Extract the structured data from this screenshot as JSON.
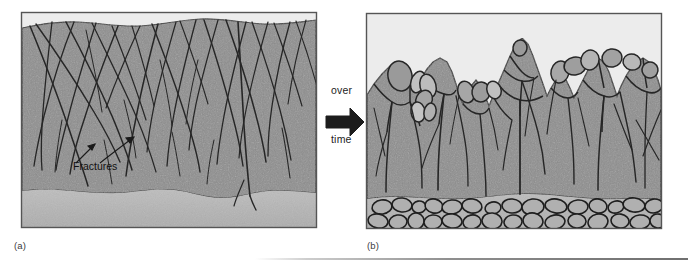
{
  "figure": {
    "type": "geological-cross-section-diagram",
    "panels": [
      {
        "id": "a",
        "caption": "(a)",
        "description": "Intact bedrock cut by intersecting fractures, overlain by thin soil and underlain by lighter regolith",
        "annotation": "Fractures",
        "frame": {
          "x": 21,
          "y": 12,
          "width": 296,
          "height": 216
        }
      },
      {
        "id": "b",
        "caption": "(b)",
        "description": "Weathered bedrock with rounded corestones and boulders, residual cobble layer at base",
        "frame": {
          "x": 366,
          "y": 13,
          "width": 296,
          "height": 216
        }
      }
    ],
    "transition": {
      "line1": "over",
      "line2": "time",
      "icon": "right-arrow-icon"
    },
    "colors": {
      "bedrock": "#8d8d8d",
      "bedrock_dark": "#838383",
      "regolith": "#b7b7b7",
      "sky": "#ececec",
      "boulder_light": "#a9a9a9",
      "boulder_pale": "#c2c2c2",
      "fracture": "#2a2a2a",
      "frame": "#555555",
      "rule": "#7a7a7a"
    }
  }
}
